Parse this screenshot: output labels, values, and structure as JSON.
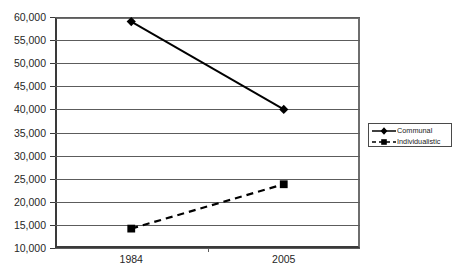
{
  "chart_data": {
    "type": "line",
    "title": "",
    "xlabel": "",
    "ylabel": "",
    "categories": [
      "1984",
      "2005"
    ],
    "x": [
      "1984",
      "2005"
    ],
    "series": [
      {
        "name": "Communal",
        "values": [
          59000,
          40000
        ],
        "line_style": "solid",
        "marker": "diamond",
        "color": "#000000"
      },
      {
        "name": "Individualistic",
        "values": [
          14200,
          23800
        ],
        "line_style": "dashed",
        "marker": "square",
        "color": "#000000"
      }
    ],
    "ylim": [
      10000,
      60000
    ],
    "ytick_step": 5000,
    "ytick_labels": [
      "60,000",
      "55,000",
      "50,000",
      "45,000",
      "40,000",
      "35,000",
      "30,000",
      "25,000",
      "20,000",
      "15,000",
      "10,000"
    ],
    "ytick_values": [
      60000,
      55000,
      50000,
      45000,
      40000,
      35000,
      30000,
      25000,
      20000,
      15000,
      10000
    ],
    "grid": true,
    "grid_axis": "y",
    "legend_position": "right"
  },
  "legend": {
    "entries": [
      {
        "label": "Communal",
        "marker": "diamond-marker",
        "line": "solid-line"
      },
      {
        "label": "Individualistic",
        "marker": "square-marker",
        "line": "dashed-line"
      }
    ]
  },
  "colors": {
    "series": "#000000",
    "gridline": "#5c5c5c",
    "axis": "#3a3a3a",
    "background": "#ffffff",
    "text": "#262626"
  }
}
